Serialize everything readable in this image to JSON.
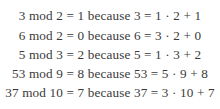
{
  "page": {
    "background_color": "#ffffff",
    "text_color": "#3a3a3a",
    "alignment": "center"
  },
  "content": {
    "title": "Modular arithmetic examples",
    "lines": [
      {
        "text": "3 mod 2 = 1 because 3 = 1 · 2 + 1",
        "dividend": 3,
        "divisor": 2,
        "remainder": 1,
        "quotient": 1
      },
      {
        "text": "6 mod 2 = 0 because 6 = 3 · 2 + 0",
        "dividend": 6,
        "divisor": 2,
        "remainder": 0,
        "quotient": 3
      },
      {
        "text": "5 mod 3 = 2 because 5 = 1 · 3 + 2",
        "dividend": 5,
        "divisor": 3,
        "remainder": 2,
        "quotient": 1
      },
      {
        "text": "53 mod 9 = 8 because 53 = 5 · 9 + 8",
        "dividend": 53,
        "divisor": 9,
        "remainder": 8,
        "quotient": 5
      },
      {
        "text": "37 mod 10 = 7 because 37 = 3 · 10 + 7",
        "dividend": 37,
        "divisor": 10,
        "remainder": 7,
        "quotient": 3
      }
    ]
  }
}
